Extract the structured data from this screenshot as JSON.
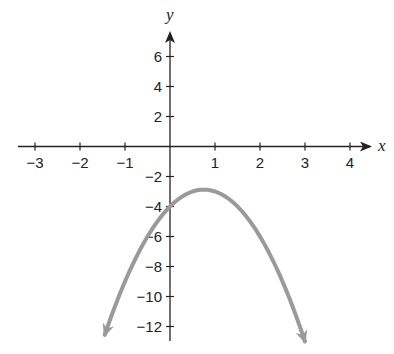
{
  "chart_data": {
    "type": "line",
    "title": "",
    "xlabel": "x",
    "ylabel": "y",
    "xlim": [
      -3.4,
      4.5
    ],
    "ylim": [
      -13,
      7.5
    ],
    "grid": false,
    "x_ticks": [
      -3,
      -2,
      -1,
      1,
      2,
      3,
      4
    ],
    "y_ticks": [
      6,
      4,
      2,
      -2,
      -4,
      -6,
      -8,
      -10,
      -12
    ],
    "series": [
      {
        "name": "parabola",
        "equation": "y = -2x^2 + 3x - 4",
        "color": "#9a9a9a",
        "vertex": [
          0.75,
          -2.875
        ],
        "y_intercept": -4,
        "x_range": [
          -1.45,
          3.0
        ],
        "arrows_at_ends": true
      }
    ]
  },
  "axes": {
    "x_label": "x",
    "y_label": "y",
    "axis_color": "#222222",
    "curve_color": "#9a9a9a"
  }
}
